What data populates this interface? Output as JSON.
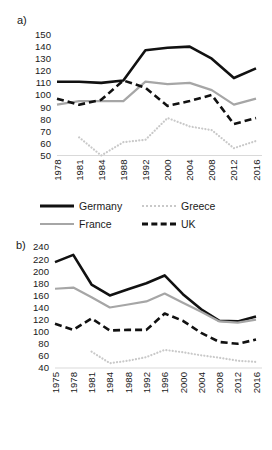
{
  "figure": {
    "panels": [
      {
        "id": "a",
        "label": "a)",
        "yticks": [
          "150",
          "140",
          "130",
          "120",
          "110",
          "100",
          "90",
          "80",
          "70",
          "60",
          "50"
        ],
        "xticks": [
          "1978",
          "1981",
          "1984",
          "1988",
          "1992",
          "2000",
          "2004",
          "2008",
          "2012",
          "2016"
        ]
      },
      {
        "id": "b",
        "label": "b)",
        "yticks": [
          "240",
          "220",
          "200",
          "180",
          "160",
          "140",
          "120",
          "100",
          "80",
          "60",
          "40"
        ],
        "xticks": [
          "1975",
          "1978",
          "1981",
          "1984",
          "1988",
          "1992",
          "1996",
          "2000",
          "2004",
          "2008",
          "2012",
          "2016"
        ]
      }
    ]
  },
  "legend": {
    "germany": "Germany",
    "greece": "Greece",
    "france": "France",
    "uk": "UK"
  },
  "colors": {
    "germany": "#111111",
    "france": "#a6a6a6",
    "greece": "#c9c9c9",
    "uk": "#111111",
    "axis": "#d9d9d9",
    "text": "#1a1a1a",
    "background": "#ffffff"
  },
  "chart_data": [
    {
      "type": "line",
      "title": "a)",
      "xlabel": "",
      "ylabel": "",
      "x": [
        1978,
        1981,
        1984,
        1988,
        1992,
        2000,
        2004,
        2008,
        2012,
        2016
      ],
      "xlim": [
        1978,
        2016
      ],
      "ylim": [
        50,
        150
      ],
      "ytick_step": 10,
      "grid": false,
      "legend_position": "bottom",
      "series": [
        {
          "name": "Germany",
          "style": "solid",
          "color": "#111111",
          "values": [
            111,
            111,
            110,
            112,
            137,
            139,
            140,
            130,
            114,
            122
          ]
        },
        {
          "name": "France",
          "style": "solid",
          "color": "#a6a6a6",
          "values": [
            92,
            95,
            95,
            95,
            111,
            109,
            110,
            104,
            92,
            97
          ]
        },
        {
          "name": "Greece",
          "style": "dotted",
          "color": "#c9c9c9",
          "values": [
            null,
            65,
            50,
            61,
            63,
            81,
            74,
            71,
            56,
            62
          ]
        },
        {
          "name": "UK",
          "style": "dashed",
          "color": "#111111",
          "values": [
            97,
            92,
            96,
            112,
            106,
            91,
            95,
            100,
            76,
            81
          ]
        }
      ]
    },
    {
      "type": "line",
      "title": "b)",
      "xlabel": "",
      "ylabel": "",
      "x": [
        1975,
        1978,
        1981,
        1984,
        1988,
        1992,
        1996,
        2000,
        2004,
        2008,
        2012,
        2016
      ],
      "xlim": [
        1975,
        2016
      ],
      "ylim": [
        40,
        240
      ],
      "ytick_step": 20,
      "grid": false,
      "legend_position": "bottom",
      "series": [
        {
          "name": "Germany",
          "style": "solid",
          "color": "#111111",
          "values": [
            215,
            227,
            178,
            160,
            170,
            180,
            193,
            162,
            137,
            118,
            117,
            125
          ]
        },
        {
          "name": "France",
          "style": "solid",
          "color": "#a6a6a6",
          "values": [
            171,
            173,
            157,
            140,
            145,
            150,
            163,
            148,
            133,
            117,
            115,
            120
          ]
        },
        {
          "name": "Greece",
          "style": "dotted",
          "color": "#c9c9c9",
          "values": [
            null,
            null,
            67,
            48,
            52,
            58,
            70,
            66,
            61,
            57,
            52,
            50
          ]
        },
        {
          "name": "UK",
          "style": "dashed",
          "color": "#111111",
          "values": [
            113,
            103,
            122,
            102,
            103,
            103,
            130,
            118,
            98,
            83,
            80,
            87
          ]
        }
      ]
    }
  ]
}
